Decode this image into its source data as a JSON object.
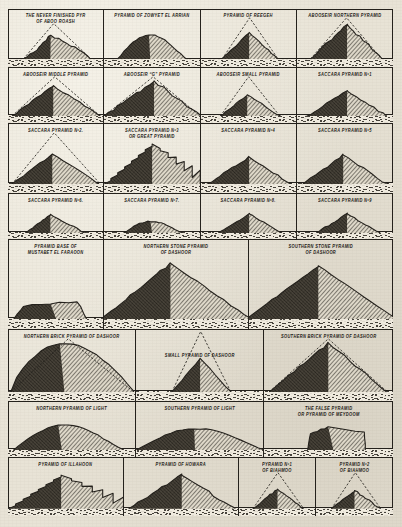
{
  "plate": {
    "title_hidden": "",
    "paper_color": "#e8e3d6",
    "ink_color": "#24211c"
  },
  "rows": [
    {
      "id": "row-1",
      "height": 58,
      "cells": [
        {
          "name": "pyramid-abu-roash",
          "caption": [
            "THE NEVER FINISHED PYR",
            "OF ABOO ROASH"
          ],
          "caption_lines": 2,
          "width": 25,
          "shape": "flat-ruin",
          "dashed": true,
          "peak_x": 0.44,
          "peak_y": 0.3,
          "base_left": 0.16,
          "base_right": 0.86
        },
        {
          "name": "pyramid-zowyet-el-arrian",
          "caption": [
            "PYRAMID OF ZOWYET EL ARRIAN"
          ],
          "caption_lines": 1,
          "width": 25,
          "shape": "low-mound",
          "dashed": false,
          "peak_x": 0.48,
          "peak_y": 0.4,
          "base_left": 0.14,
          "base_right": 0.86
        },
        {
          "name": "pyramid-of-reegeh",
          "caption": [
            "PYRAMID   OF   REEGEH"
          ],
          "caption_lines": 1,
          "width": 25,
          "shape": "rubble-cone",
          "dashed": true,
          "peak_x": 0.5,
          "peak_y": 0.34,
          "base_left": 0.22,
          "base_right": 0.8
        },
        {
          "name": "pyramid-abooseir-northern",
          "caption": [
            "ABOOSEIR NORTHERN PYRAMID"
          ],
          "caption_lines": 1,
          "width": 25,
          "shape": "steep-mound",
          "dashed": true,
          "peak_x": 0.52,
          "peak_y": 0.14,
          "base_left": 0.14,
          "base_right": 0.88
        }
      ]
    },
    {
      "id": "row-2",
      "height": 56,
      "cells": [
        {
          "name": "pyramid-abooseir-middle",
          "caption": [
            "ABOOSEIR MIDDLE PYRAMID"
          ],
          "caption_lines": 1,
          "width": 25,
          "shape": "mound-wide",
          "dashed": true,
          "peak_x": 0.47,
          "peak_y": 0.2,
          "base_left": 0.04,
          "base_right": 0.96
        },
        {
          "name": "pyramid-abooseir-g",
          "caption": [
            "ABOOSEIR  “G” PYRAMID"
          ],
          "caption_lines": 1,
          "width": 25,
          "shape": "craggy-big",
          "dashed": true,
          "peak_x": 0.52,
          "peak_y": 0.08,
          "base_left": 0.0,
          "base_right": 1.0
        },
        {
          "name": "pyramid-abooseir-small",
          "caption": [
            "ABOOSEIR SMALL PYRAMID"
          ],
          "caption_lines": 1,
          "width": 25,
          "shape": "rubble-cone",
          "dashed": true,
          "peak_x": 0.48,
          "peak_y": 0.44,
          "base_left": 0.2,
          "base_right": 0.82
        },
        {
          "name": "pyramid-saccara-1",
          "caption": [
            "SACCARA  PYRAMID Nº1"
          ],
          "caption_lines": 1,
          "width": 25,
          "shape": "mound-wide",
          "dashed": false,
          "peak_x": 0.52,
          "peak_y": 0.34,
          "base_left": 0.1,
          "base_right": 0.94
        }
      ]
    },
    {
      "id": "row-3",
      "height": 70,
      "cells": [
        {
          "name": "pyramid-saccara-2",
          "caption": [
            "SACCARA  PYRAMID  Nº2."
          ],
          "caption_lines": 1,
          "width": 25,
          "shape": "mound-wide",
          "dashed": true,
          "peak_x": 0.46,
          "peak_y": 0.4,
          "base_left": 0.04,
          "base_right": 0.96
        },
        {
          "name": "pyramid-saccara-3-great",
          "caption": [
            "SACCARA  PYRAMID Nº3",
            "OR GREAT  PYRAMID"
          ],
          "caption_lines": 2,
          "width": 25,
          "shape": "step-pyramid",
          "dashed": false,
          "peak_x": 0.5,
          "peak_y": 0.1,
          "base_left": 0.0,
          "base_right": 1.0
        },
        {
          "name": "pyramid-saccara-4",
          "caption": [
            "SACCARA PYRAMID Nº4"
          ],
          "caption_lines": 1,
          "width": 25,
          "shape": "mound-wide",
          "dashed": false,
          "peak_x": 0.5,
          "peak_y": 0.46,
          "base_left": 0.06,
          "base_right": 0.94
        },
        {
          "name": "pyramid-saccara-5",
          "caption": [
            "SACCARA  PYRAMID  Nº5"
          ],
          "caption_lines": 1,
          "width": 25,
          "shape": "mound-wide",
          "dashed": false,
          "peak_x": 0.48,
          "peak_y": 0.42,
          "base_left": 0.06,
          "base_right": 0.94
        }
      ]
    },
    {
      "id": "row-4",
      "height": 46,
      "cells": [
        {
          "name": "pyramid-saccara-6",
          "caption": [
            "SACCARA  PYRAMID  Nº6."
          ],
          "caption_lines": 1,
          "width": 25,
          "shape": "rubble-cone",
          "dashed": false,
          "peak_x": 0.44,
          "peak_y": 0.36,
          "base_left": 0.18,
          "base_right": 0.8
        },
        {
          "name": "pyramid-saccara-7",
          "caption": [
            "SACCARA  PYRAMID  Nº7."
          ],
          "caption_lines": 1,
          "width": 25,
          "shape": "low-mound",
          "dashed": false,
          "peak_x": 0.5,
          "peak_y": 0.6,
          "base_left": 0.2,
          "base_right": 0.82
        },
        {
          "name": "pyramid-saccara-8",
          "caption": [
            "SACCARA  PYRAMID  Nº8."
          ],
          "caption_lines": 1,
          "width": 25,
          "shape": "rubble-cone",
          "dashed": false,
          "peak_x": 0.5,
          "peak_y": 0.34,
          "base_left": 0.18,
          "base_right": 0.84
        },
        {
          "name": "pyramid-saccara-9",
          "caption": [
            "SACCARA  PYRAMID  Nº9"
          ],
          "caption_lines": 1,
          "width": 25,
          "shape": "rubble-cone",
          "dashed": false,
          "peak_x": 0.52,
          "peak_y": 0.34,
          "base_left": 0.2,
          "base_right": 0.86
        }
      ]
    },
    {
      "id": "row-5",
      "height": 90,
      "cells": [
        {
          "name": "pyramid-base-mustabet-el-faraoon",
          "caption": [
            "PYRAMID BASE OF",
            "MUSTABET EL FARAOON"
          ],
          "caption_lines": 2,
          "width": 25,
          "shape": "mastaba",
          "dashed": false,
          "peak_x": 0.5,
          "peak_y": 0.72,
          "base_left": 0.06,
          "base_right": 0.82
        },
        {
          "name": "pyramid-northern-stone-dashoor",
          "caption": [
            "NORTHERN            STONE   PYRAMID",
            "OF                              DASHOOR"
          ],
          "caption_lines": 2,
          "width": 37.5,
          "shape": "great-pyramid",
          "dashed": false,
          "peak_x": 0.46,
          "peak_y": 0.12,
          "base_left": -0.02,
          "base_right": 1.02
        },
        {
          "name": "pyramid-southern-stone-dashoor",
          "caption": [
            "SOUTHERN          STONE  PYRAMID",
            "OF                            DASHOOR"
          ],
          "caption_lines": 2,
          "width": 37.5,
          "shape": "great-pyramid-smooth",
          "dashed": false,
          "peak_x": 0.48,
          "peak_y": 0.16,
          "base_left": -0.02,
          "base_right": 1.02
        }
      ]
    },
    {
      "id": "row-6",
      "height": 72,
      "cells": [
        {
          "name": "pyramid-northern-brick-dashoor",
          "caption": [
            "NORTHERN BRICK PYRAMID OF DASHOOR"
          ],
          "caption_lines": 1,
          "width": 33.3,
          "shape": "wide-eroded",
          "dashed": true,
          "peak_x": 0.44,
          "peak_y": 0.06,
          "base_left": 0.02,
          "base_right": 0.98
        },
        {
          "name": "pyramid-small-dashoor",
          "caption": [
            "SMALL PYRAMID OF DASHOOR"
          ],
          "caption_lines": 1,
          "caption_low": true,
          "width": 33.3,
          "shape": "sharp-cone",
          "dashed": true,
          "peak_x": 0.5,
          "peak_y": 0.44,
          "base_left": 0.28,
          "base_right": 0.74
        },
        {
          "name": "pyramid-southern-brick-dashoor",
          "caption": [
            "SOUTHERN BRICK PYRAMID OF DASHOOR"
          ],
          "caption_lines": 1,
          "width": 33.4,
          "shape": "steep-mound",
          "dashed": true,
          "peak_x": 0.5,
          "peak_y": 0.06,
          "base_left": 0.04,
          "base_right": 0.96
        }
      ]
    },
    {
      "id": "row-7",
      "height": 56,
      "cells": [
        {
          "name": "pyramid-northern-of-light",
          "caption": [
            "NORTHERN PYRAMID OF LIGHT"
          ],
          "caption_lines": 1,
          "width": 33.3,
          "shape": "dome-mound",
          "dashed": false,
          "peak_x": 0.42,
          "peak_y": 0.34,
          "base_left": 0.04,
          "base_right": 0.9
        },
        {
          "name": "pyramid-southern-of-light",
          "caption": [
            "SOUTHERN PYRAMID OF LIGHT"
          ],
          "caption_lines": 1,
          "width": 33.3,
          "shape": "low-broad",
          "dashed": false,
          "peak_x": 0.46,
          "peak_y": 0.44,
          "base_left": 0.0,
          "base_right": 1.0
        },
        {
          "name": "pyramid-false-meydoom",
          "caption": [
            "THE FALSE PYRAMID",
            "OR PYRAMID OF MEYDOOM"
          ],
          "caption_lines": 2,
          "width": 33.4,
          "shape": "tower-block",
          "dashed": false,
          "peak_x": 0.54,
          "peak_y": 0.3,
          "base_left": 0.34,
          "base_right": 0.78
        }
      ]
    },
    {
      "id": "row-8",
      "height": 59,
      "cells": [
        {
          "name": "pyramid-of-illahoon",
          "caption": [
            "PYRAMID   OF   ILLAHOON"
          ],
          "caption_lines": 1,
          "width": 30,
          "shape": "step-pyramid",
          "dashed": false,
          "peak_x": 0.46,
          "peak_y": 0.18,
          "base_left": 0.0,
          "base_right": 1.0
        },
        {
          "name": "pyramid-of-howara",
          "caption": [
            "PYRAMID   OF   HOWARA"
          ],
          "caption_lines": 1,
          "width": 30,
          "shape": "craggy-big",
          "dashed": false,
          "peak_x": 0.5,
          "peak_y": 0.18,
          "base_left": 0.04,
          "base_right": 0.96
        },
        {
          "name": "pyramid-biahmoo-1",
          "caption": [
            "PYRAMID Nº1",
            "OF BIAHMOO"
          ],
          "caption_lines": 2,
          "width": 20,
          "shape": "rubble-cone",
          "dashed": true,
          "peak_x": 0.5,
          "peak_y": 0.44,
          "base_left": 0.18,
          "base_right": 0.84
        },
        {
          "name": "pyramid-biahmoo-2",
          "caption": [
            "PYRAMID Nº2",
            "OF BIAHMOO"
          ],
          "caption_lines": 2,
          "width": 20,
          "shape": "rubble-cone",
          "dashed": true,
          "peak_x": 0.5,
          "peak_y": 0.48,
          "base_left": 0.2,
          "base_right": 0.84
        }
      ]
    }
  ]
}
